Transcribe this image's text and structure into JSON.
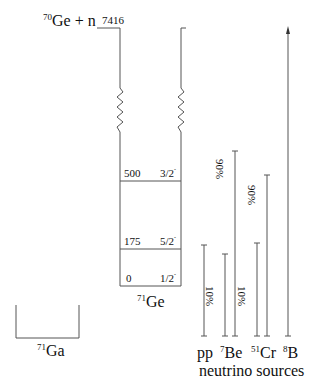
{
  "diagram": {
    "reaction": {
      "prefix_sup": "70",
      "label": "Ge + n",
      "energy": "7416"
    },
    "ge71": {
      "sup": "71",
      "label": "Ge",
      "levels": [
        {
          "energy": "500",
          "spin": "3/2",
          "parity": "-"
        },
        {
          "energy": "175",
          "spin": "5/2",
          "parity": "-"
        },
        {
          "energy": "0",
          "spin": "1/2",
          "parity": "-"
        }
      ]
    },
    "ga71": {
      "sup": "71",
      "label": "Ga"
    },
    "neutrino_sources": {
      "caption": "neutrino sources",
      "sources": [
        {
          "name": "pp",
          "sup": ""
        },
        {
          "name": "Be",
          "sup": "7",
          "branches": [
            "10%",
            "90%"
          ]
        },
        {
          "name": "Cr",
          "sup": "51",
          "branches": [
            "10%",
            "90%"
          ]
        },
        {
          "name": "B",
          "sup": "8"
        }
      ]
    }
  }
}
